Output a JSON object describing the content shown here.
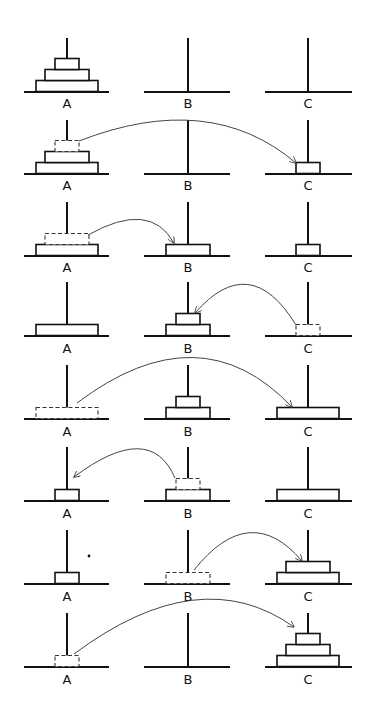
{
  "pegs": [
    {
      "label": "A",
      "x": 67,
      "base_x1": 24,
      "base_x2": 109
    },
    {
      "label": "B",
      "x": 188,
      "base_x1": 144,
      "base_x2": 230
    },
    {
      "label": "C",
      "x": 308,
      "base_x1": 265,
      "base_x2": 352
    }
  ],
  "disc_widths": {
    "small": 24,
    "medium": 44,
    "large": 62
  },
  "disc_height": 11,
  "peg_height": 54,
  "rows": [
    {
      "step": 0,
      "base_y": 92,
      "label_y": 104,
      "stacks": {
        "A": [
          "large",
          "medium",
          "small"
        ],
        "B": [],
        "C": []
      },
      "ghost": null,
      "arrow": null
    },
    {
      "step": 1,
      "base_y": 174,
      "label_y": 186,
      "stacks": {
        "A": [
          "large",
          "medium"
        ],
        "B": [],
        "C": [
          "small"
        ]
      },
      "ghost": {
        "peg": "A",
        "size": "small",
        "level": 2
      },
      "arrow": {
        "from": [
          79,
          141
        ],
        "ctrl": [
          210,
          90
        ],
        "to": [
          296,
          163
        ]
      }
    },
    {
      "step": 2,
      "base_y": 256,
      "label_y": 268,
      "stacks": {
        "A": [
          "large"
        ],
        "B": [
          "medium"
        ],
        "C": [
          "small"
        ]
      },
      "ghost": {
        "peg": "A",
        "size": "medium",
        "level": 1
      },
      "arrow": {
        "from": [
          88,
          235
        ],
        "ctrl": [
          150,
          200
        ],
        "to": [
          174,
          243
        ]
      }
    },
    {
      "step": 3,
      "base_y": 336,
      "label_y": 349,
      "stacks": {
        "A": [
          "large"
        ],
        "B": [
          "medium",
          "small"
        ],
        "C": []
      },
      "ghost": {
        "peg": "C",
        "size": "small",
        "level": 0
      },
      "arrow": {
        "from": [
          296,
          325
        ],
        "ctrl": [
          250,
          250
        ],
        "to": [
          195,
          313
        ]
      }
    },
    {
      "step": 4,
      "base_y": 419,
      "label_y": 432,
      "stacks": {
        "A": [],
        "B": [
          "medium",
          "small"
        ],
        "C": [
          "large"
        ]
      },
      "ghost": {
        "peg": "A",
        "size": "large",
        "level": 0
      },
      "arrow": {
        "from": [
          77,
          403
        ],
        "ctrl": [
          200,
          310
        ],
        "to": [
          292,
          407
        ]
      }
    },
    {
      "step": 5,
      "base_y": 501,
      "label_y": 514,
      "stacks": {
        "A": [
          "small"
        ],
        "B": [
          "medium"
        ],
        "C": [
          "large"
        ]
      },
      "ghost": {
        "peg": "B",
        "size": "small",
        "level": 1
      },
      "arrow": {
        "from": [
          175,
          478
        ],
        "ctrl": [
          150,
          420
        ],
        "to": [
          74,
          477
        ]
      }
    },
    {
      "step": 6,
      "base_y": 584,
      "label_y": 597,
      "stacks": {
        "A": [
          "small"
        ],
        "B": [],
        "C": [
          "large",
          "medium"
        ]
      },
      "ghost": {
        "peg": "B",
        "size": "medium",
        "level": 0
      },
      "arrow": {
        "from": [
          194,
          570
        ],
        "ctrl": [
          250,
          500
        ],
        "to": [
          302,
          561
        ]
      }
    },
    {
      "step": 7,
      "base_y": 667,
      "label_y": 680,
      "stacks": {
        "A": [],
        "B": [],
        "C": [
          "large",
          "medium",
          "small"
        ]
      },
      "ghost": {
        "peg": "A",
        "size": "small",
        "level": 0
      },
      "arrow": {
        "from": [
          74,
          654
        ],
        "ctrl": [
          200,
          560
        ],
        "to": [
          294,
          627
        ]
      }
    }
  ],
  "stray_dot": {
    "x": 89,
    "y": 556
  },
  "colors": {
    "ink": "#111111",
    "background": "#ffffff"
  }
}
